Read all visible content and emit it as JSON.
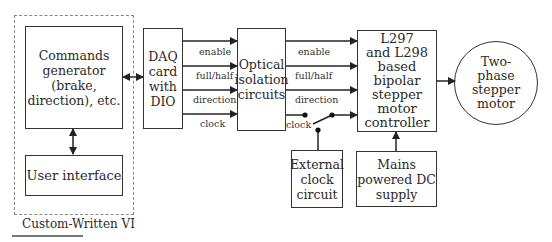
{
  "group": {
    "label": "Custom-Written VI"
  },
  "blocks": {
    "commands": "Commands\ngenerator (brake,\ndirection), etc.",
    "user_interface": "User interface",
    "daq": "DAQ\ncard with\nDIO",
    "optical": "Optical\nisolation\ncircuits",
    "controller": "L297\nand L298\nbased\nbipolar\nstepper\nmotor\ncontroller",
    "motor": "Two-\nphase\nstepper\nmotor",
    "ext_clock": "External\nclock\ncircuit",
    "mains": "Mains\npowered DC\nsupply"
  },
  "signals_daq_to_optical": [
    "enable",
    "full/half",
    "direction",
    "clock"
  ],
  "signals_optical_to_controller": [
    "enable",
    "full/half",
    "direction",
    "clock"
  ]
}
